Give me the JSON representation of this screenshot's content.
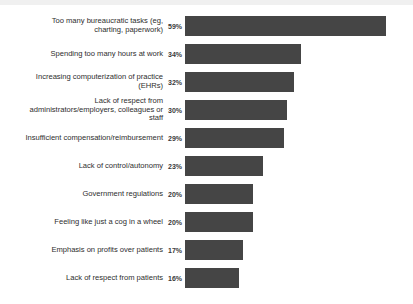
{
  "chart_data": {
    "type": "bar",
    "orientation": "horizontal",
    "title": "",
    "subtitle": "",
    "xlabel": "",
    "ylabel": "",
    "grid": false,
    "legend": null,
    "xlim": [
      0,
      60
    ],
    "value_suffix": "%",
    "bar_color": "#454545",
    "background_color": "#ffffff",
    "categories": [
      "Too many bureaucratic tasks (eg,\ncharting, paperwork)",
      "Spending too many hours at work",
      "Increasing computerization of practice\n(EHRs)",
      "Lack of respect from\nadministrators/employers, colleagues or\nstaff",
      "Insufficient compensation/reimbursement",
      "Lack of control/autonomy",
      "Government regulations",
      "Feeling like just a cog in a wheel",
      "Emphasis on profits over patients",
      "Lack of respect from patients"
    ],
    "values": [
      59,
      34,
      32,
      30,
      29,
      23,
      20,
      20,
      17,
      16
    ],
    "value_labels": [
      "59%",
      "34%",
      "32%",
      "30%",
      "29%",
      "23%",
      "20%",
      "20%",
      "17%",
      "16%"
    ],
    "rows": [
      {
        "label": "Too many bureaucratic tasks (eg,\ncharting, paperwork)",
        "value": 59,
        "value_label": "59%"
      },
      {
        "label": "Spending too many hours at work",
        "value": 34,
        "value_label": "34%"
      },
      {
        "label": "Increasing computerization of practice\n(EHRs)",
        "value": 32,
        "value_label": "32%"
      },
      {
        "label": "Lack of respect from\nadministrators/employers, colleagues or\nstaff",
        "value": 30,
        "value_label": "30%"
      },
      {
        "label": "Insufficient compensation/reimbursement",
        "value": 29,
        "value_label": "29%"
      },
      {
        "label": "Lack of control/autonomy",
        "value": 23,
        "value_label": "23%"
      },
      {
        "label": "Government regulations",
        "value": 20,
        "value_label": "20%"
      },
      {
        "label": "Feeling like just a cog in a wheel",
        "value": 20,
        "value_label": "20%"
      },
      {
        "label": "Emphasis on profits over patients",
        "value": 17,
        "value_label": "17%"
      },
      {
        "label": "Lack of respect from patients",
        "value": 16,
        "value_label": "16%"
      }
    ]
  },
  "layout": {
    "row_pitch": 28,
    "first_row_top": 10,
    "bar_origin_x": 203,
    "px_per_percent": 3.4
  }
}
